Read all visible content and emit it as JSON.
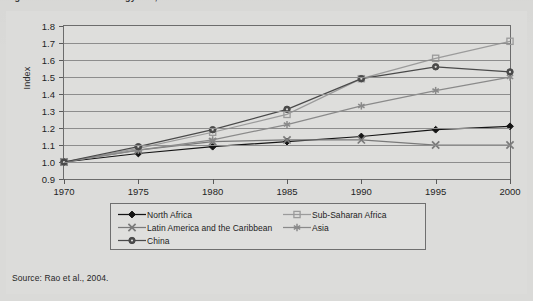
{
  "figure": {
    "title_partial": "Figure 4.1   Increase in energy use, 1970–2000",
    "source_note": "Source: Rao et al., 2004."
  },
  "chart_data": {
    "type": "line",
    "title": "",
    "xlabel": "",
    "ylabel": "Index",
    "x": [
      1970,
      1975,
      1980,
      1985,
      1990,
      1995,
      2000
    ],
    "xticklabels": [
      "1970",
      "1975",
      "1980",
      "1985",
      "1990",
      "1995",
      "2000"
    ],
    "yticklabels": [
      "0.9",
      "1.0",
      "1.1",
      "1.2",
      "1.3",
      "1.4",
      "1.5",
      "1.6",
      "1.7",
      "1.8"
    ],
    "ylim": [
      0.9,
      1.8
    ],
    "ytick_step": 0.1,
    "grid": "horizontal",
    "legend_position": "below-plot",
    "series": [
      {
        "name": "North Africa",
        "marker": "filled-diamond",
        "color": "#141414",
        "values": [
          1.0,
          1.05,
          1.09,
          1.12,
          1.15,
          1.19,
          1.21
        ]
      },
      {
        "name": "Sub-Saharan Africa",
        "marker": "open-square",
        "color": "#9b9b9b",
        "values": [
          1.0,
          1.08,
          1.175,
          1.28,
          1.49,
          1.61,
          1.71
        ]
      },
      {
        "name": "Latin America and the Caribbean",
        "marker": "cross-x",
        "color": "#7a7a7a",
        "values": [
          1.0,
          1.07,
          1.12,
          1.13,
          1.13,
          1.1,
          1.1
        ]
      },
      {
        "name": "Asia",
        "marker": "asterisk",
        "color": "#8a8a8a",
        "values": [
          1.0,
          1.07,
          1.13,
          1.22,
          1.33,
          1.42,
          1.5
        ]
      },
      {
        "name": "China",
        "marker": "filled-circle",
        "color": "#4a4a4a",
        "values": [
          1.0,
          1.09,
          1.19,
          1.31,
          1.49,
          1.56,
          1.53
        ]
      }
    ]
  }
}
